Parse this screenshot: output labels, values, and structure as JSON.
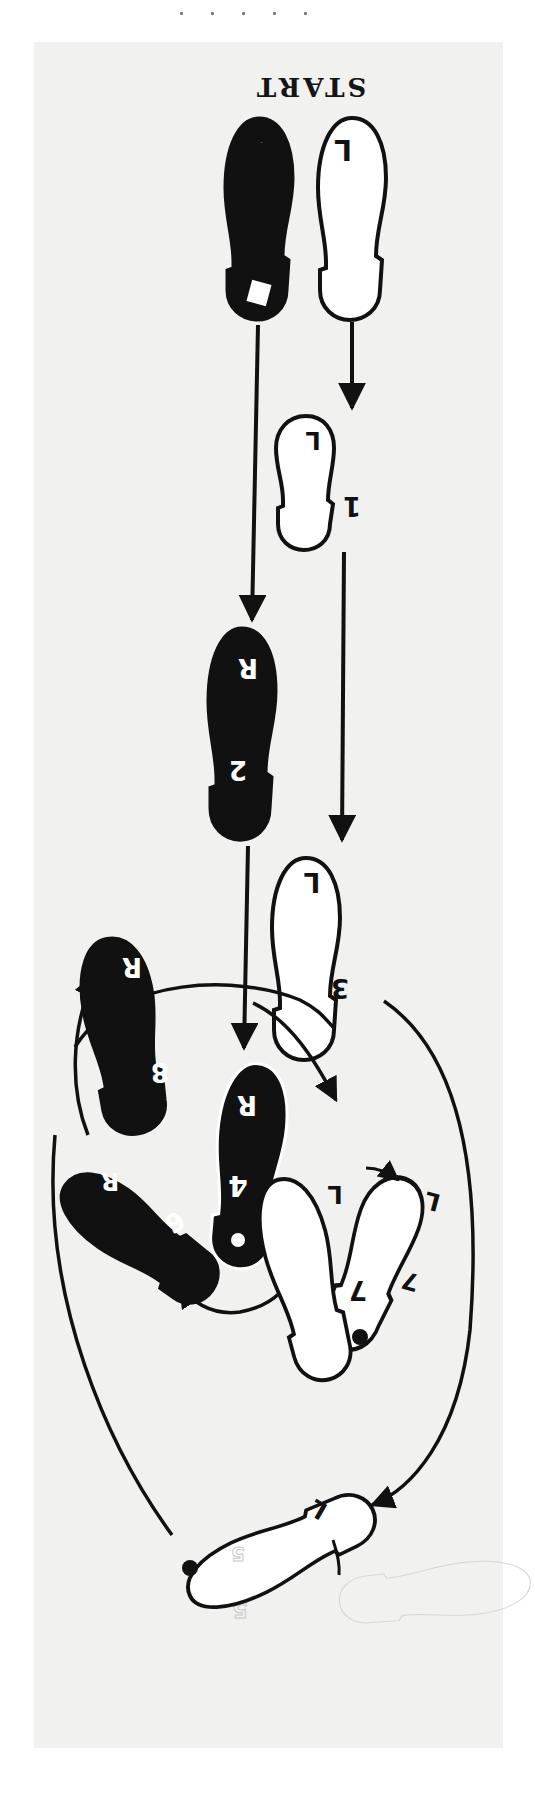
{
  "diagram": {
    "title": "START",
    "orientation": "printed upside down (rotated 180°)",
    "colors": {
      "paper": "#f1f1f0",
      "ink": "#111111",
      "right_foot_fill": "#111111",
      "left_foot_fill": "#ffffff",
      "ghost": "#c9c9c9"
    },
    "start_position": {
      "left_foot": {
        "side_label": "L",
        "fill": "white"
      },
      "right_foot": {
        "side_label": "R",
        "fill": "black"
      }
    },
    "steps": [
      {
        "number": "1",
        "foot": "L",
        "fill": "white"
      },
      {
        "number": "2",
        "foot": "R",
        "fill": "black"
      },
      {
        "number": "3",
        "foot": "L",
        "fill": "white"
      },
      {
        "number": "4",
        "foot": "R",
        "fill": "black",
        "pivot_dot": true
      },
      {
        "number": "5",
        "foot": "L",
        "fill": "white",
        "pivot_dot": true,
        "ghost_overlay": true
      },
      {
        "number": "6",
        "foot": "R",
        "fill": "black"
      },
      {
        "number": "7",
        "foot": "L",
        "fill": "white",
        "pivot_dot": true,
        "positions": 2
      },
      {
        "number": "8",
        "foot": "R",
        "fill": "black"
      }
    ],
    "labels": {
      "start_L": "L",
      "start_R": "R",
      "s1_num": "1",
      "s1_side": "L",
      "s2_num": "2",
      "s2_side": "R",
      "s3_num": "3",
      "s3_side": "L",
      "s4_num": "4",
      "s4_side": "R",
      "s5_num": "5",
      "s5_side": "L",
      "s6_num": "6",
      "s6_side": "R",
      "s7a_num": "7",
      "s7a_side": "L",
      "s7b_num": "7",
      "s7b_side": "L",
      "s8_num": "8",
      "s8_side": "R"
    }
  }
}
